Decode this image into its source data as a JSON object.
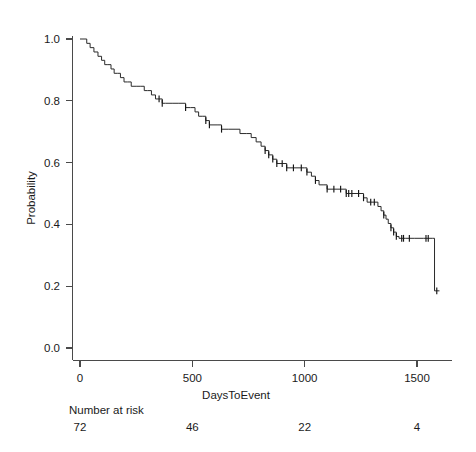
{
  "chart_data": {
    "type": "line",
    "subtype": "kaplan-meier-survival",
    "title": "",
    "xlabel": "DaysToEvent",
    "ylabel": "Probability",
    "xlim": [
      0,
      1610
    ],
    "ylim": [
      0.0,
      1.0
    ],
    "xticks": [
      0,
      500,
      1000,
      1500
    ],
    "xtick_labels": [
      "0",
      "500",
      "1000",
      "1500"
    ],
    "yticks": [
      0.0,
      0.2,
      0.4,
      0.6,
      0.8,
      1.0
    ],
    "ytick_labels": [
      "0.0",
      "0.2",
      "0.4",
      "0.6",
      "0.8",
      "1.0"
    ],
    "grid": false,
    "legend": false,
    "line_color": "#2b2b2b",
    "axis_color": "#4a4a4a",
    "background": "#ffffff",
    "series": [
      {
        "name": "Survival",
        "step": "post",
        "points": [
          [
            0,
            1.0
          ],
          [
            18,
            1.0
          ],
          [
            30,
            0.986
          ],
          [
            45,
            0.972
          ],
          [
            62,
            0.958
          ],
          [
            80,
            0.944
          ],
          [
            96,
            0.931
          ],
          [
            110,
            0.917
          ],
          [
            124,
            0.917
          ],
          [
            138,
            0.903
          ],
          [
            152,
            0.889
          ],
          [
            166,
            0.889
          ],
          [
            180,
            0.875
          ],
          [
            196,
            0.861
          ],
          [
            212,
            0.861
          ],
          [
            228,
            0.847
          ],
          [
            250,
            0.847
          ],
          [
            268,
            0.847
          ],
          [
            286,
            0.833
          ],
          [
            300,
            0.833
          ],
          [
            318,
            0.819
          ],
          [
            336,
            0.806
          ],
          [
            352,
            0.806
          ],
          [
            366,
            0.792
          ],
          [
            380,
            0.792
          ],
          [
            396,
            0.792
          ],
          [
            410,
            0.792
          ],
          [
            440,
            0.792
          ],
          [
            470,
            0.778
          ],
          [
            492,
            0.778
          ],
          [
            512,
            0.764
          ],
          [
            528,
            0.75
          ],
          [
            544,
            0.75
          ],
          [
            560,
            0.736
          ],
          [
            576,
            0.722
          ],
          [
            592,
            0.722
          ],
          [
            610,
            0.722
          ],
          [
            630,
            0.708
          ],
          [
            660,
            0.708
          ],
          [
            690,
            0.708
          ],
          [
            712,
            0.694
          ],
          [
            740,
            0.694
          ],
          [
            762,
            0.681
          ],
          [
            784,
            0.667
          ],
          [
            806,
            0.653
          ],
          [
            824,
            0.639
          ],
          [
            840,
            0.625
          ],
          [
            858,
            0.611
          ],
          [
            876,
            0.597
          ],
          [
            900,
            0.597
          ],
          [
            920,
            0.583
          ],
          [
            950,
            0.583
          ],
          [
            985,
            0.583
          ],
          [
            1000,
            0.583
          ],
          [
            1010,
            0.569
          ],
          [
            1030,
            0.556
          ],
          [
            1048,
            0.542
          ],
          [
            1064,
            0.528
          ],
          [
            1082,
            0.528
          ],
          [
            1100,
            0.514
          ],
          [
            1130,
            0.514
          ],
          [
            1160,
            0.514
          ],
          [
            1185,
            0.5
          ],
          [
            1210,
            0.5
          ],
          [
            1240,
            0.5
          ],
          [
            1262,
            0.486
          ],
          [
            1278,
            0.472
          ],
          [
            1294,
            0.472
          ],
          [
            1310,
            0.472
          ],
          [
            1326,
            0.458
          ],
          [
            1340,
            0.444
          ],
          [
            1352,
            0.43
          ],
          [
            1362,
            0.417
          ],
          [
            1372,
            0.403
          ],
          [
            1384,
            0.389
          ],
          [
            1396,
            0.375
          ],
          [
            1408,
            0.361
          ],
          [
            1420,
            0.355
          ],
          [
            1450,
            0.355
          ],
          [
            1490,
            0.355
          ],
          [
            1530,
            0.355
          ],
          [
            1570,
            0.355
          ],
          [
            1578,
            0.185
          ],
          [
            1600,
            0.185
          ]
        ],
        "censored": [
          [
            352,
            0.806
          ],
          [
            366,
            0.792
          ],
          [
            470,
            0.778
          ],
          [
            560,
            0.736
          ],
          [
            576,
            0.722
          ],
          [
            630,
            0.708
          ],
          [
            824,
            0.639
          ],
          [
            840,
            0.625
          ],
          [
            858,
            0.611
          ],
          [
            876,
            0.597
          ],
          [
            900,
            0.597
          ],
          [
            920,
            0.583
          ],
          [
            950,
            0.583
          ],
          [
            985,
            0.583
          ],
          [
            1010,
            0.569
          ],
          [
            1048,
            0.542
          ],
          [
            1100,
            0.514
          ],
          [
            1130,
            0.514
          ],
          [
            1160,
            0.514
          ],
          [
            1185,
            0.5
          ],
          [
            1196,
            0.5
          ],
          [
            1210,
            0.5
          ],
          [
            1240,
            0.5
          ],
          [
            1262,
            0.486
          ],
          [
            1294,
            0.472
          ],
          [
            1310,
            0.472
          ],
          [
            1352,
            0.43
          ],
          [
            1384,
            0.389
          ],
          [
            1396,
            0.375
          ],
          [
            1408,
            0.361
          ],
          [
            1432,
            0.355
          ],
          [
            1440,
            0.355
          ],
          [
            1466,
            0.355
          ],
          [
            1540,
            0.355
          ],
          [
            1550,
            0.355
          ],
          [
            1588,
            0.185
          ]
        ]
      }
    ],
    "risk_table": {
      "label": "Number at risk",
      "times": [
        0,
        500,
        1000,
        1500
      ],
      "counts": [
        72,
        46,
        22,
        4
      ],
      "counts_text": [
        "72",
        "46",
        "22",
        "4"
      ]
    }
  }
}
